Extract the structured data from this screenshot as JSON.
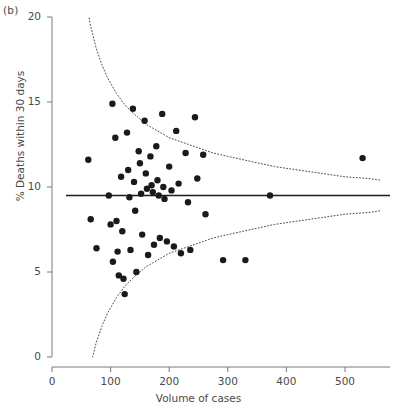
{
  "figure": {
    "panel_label": "(b)",
    "background": "#ffffff",
    "axis_color": "#7a7a7a",
    "point_color": "#1a1a1a",
    "mean_line_color": "#1a1a1a",
    "limit_line_color": "#4a4a4a"
  },
  "chart_data": {
    "type": "scatter",
    "title": "",
    "subtitle": "",
    "xlabel": "Volume of cases",
    "ylabel": "% Deaths within 30 days",
    "xlim": [
      0,
      560
    ],
    "ylim": [
      0,
      20
    ],
    "xticks": [
      0,
      100,
      200,
      300,
      400,
      500
    ],
    "yticks": [
      0,
      5,
      10,
      15,
      20
    ],
    "grid": false,
    "legend": null,
    "annotations": [
      "(b)"
    ],
    "reference_line": {
      "name": "overall mean",
      "style": "solid",
      "y": 9.5
    },
    "control_limits": {
      "name": "95% control limits",
      "style": "dotted",
      "upper": [
        [
          55,
          21.8
        ],
        [
          65,
          19.6
        ],
        [
          75,
          18.2
        ],
        [
          85,
          17.2
        ],
        [
          95,
          16.4
        ],
        [
          110,
          15.5
        ],
        [
          125,
          14.8
        ],
        [
          140,
          14.3
        ],
        [
          160,
          13.7
        ],
        [
          180,
          13.3
        ],
        [
          200,
          12.9
        ],
        [
          225,
          12.6
        ],
        [
          250,
          12.3
        ],
        [
          275,
          12.0
        ],
        [
          300,
          11.8
        ],
        [
          340,
          11.5
        ],
        [
          380,
          11.2
        ],
        [
          420,
          11.0
        ],
        [
          460,
          10.8
        ],
        [
          500,
          10.6
        ],
        [
          540,
          10.5
        ],
        [
          560,
          10.4
        ]
      ],
      "lower": [
        [
          55,
          -2.8
        ],
        [
          65,
          -0.6
        ],
        [
          75,
          0.8
        ],
        [
          85,
          1.8
        ],
        [
          95,
          2.6
        ],
        [
          110,
          3.5
        ],
        [
          125,
          4.2
        ],
        [
          140,
          4.7
        ],
        [
          160,
          5.3
        ],
        [
          180,
          5.7
        ],
        [
          200,
          6.1
        ],
        [
          225,
          6.4
        ],
        [
          250,
          6.7
        ],
        [
          275,
          7.0
        ],
        [
          300,
          7.2
        ],
        [
          340,
          7.5
        ],
        [
          380,
          7.8
        ],
        [
          420,
          8.0
        ],
        [
          460,
          8.2
        ],
        [
          500,
          8.4
        ],
        [
          540,
          8.5
        ],
        [
          560,
          8.6
        ]
      ]
    },
    "series": [
      {
        "name": "hospitals",
        "marker": "circle",
        "color": "#1a1a1a",
        "points": [
          [
            62,
            11.6
          ],
          [
            66,
            8.1
          ],
          [
            76,
            6.4
          ],
          [
            97,
            9.5
          ],
          [
            100,
            7.8
          ],
          [
            103,
            14.9
          ],
          [
            104,
            5.6
          ],
          [
            108,
            12.9
          ],
          [
            110,
            8.0
          ],
          [
            112,
            6.2
          ],
          [
            114,
            4.8
          ],
          [
            118,
            10.6
          ],
          [
            120,
            7.4
          ],
          [
            122,
            4.6
          ],
          [
            124,
            3.7
          ],
          [
            128,
            13.2
          ],
          [
            130,
            11.0
          ],
          [
            132,
            9.4
          ],
          [
            134,
            6.3
          ],
          [
            138,
            14.6
          ],
          [
            140,
            10.3
          ],
          [
            142,
            8.6
          ],
          [
            144,
            5.0
          ],
          [
            148,
            12.1
          ],
          [
            150,
            11.4
          ],
          [
            152,
            9.6
          ],
          [
            154,
            7.2
          ],
          [
            158,
            13.9
          ],
          [
            160,
            10.8
          ],
          [
            162,
            9.9
          ],
          [
            164,
            6.0
          ],
          [
            168,
            11.8
          ],
          [
            170,
            10.1
          ],
          [
            172,
            9.7
          ],
          [
            174,
            6.6
          ],
          [
            178,
            12.4
          ],
          [
            180,
            10.4
          ],
          [
            182,
            9.5
          ],
          [
            184,
            7.0
          ],
          [
            188,
            14.3
          ],
          [
            190,
            10.0
          ],
          [
            192,
            9.3
          ],
          [
            196,
            6.8
          ],
          [
            200,
            11.2
          ],
          [
            204,
            9.8
          ],
          [
            208,
            6.5
          ],
          [
            212,
            13.3
          ],
          [
            216,
            10.2
          ],
          [
            220,
            6.1
          ],
          [
            228,
            12.0
          ],
          [
            232,
            9.1
          ],
          [
            236,
            6.3
          ],
          [
            244,
            14.1
          ],
          [
            248,
            10.5
          ],
          [
            258,
            11.9
          ],
          [
            262,
            8.4
          ],
          [
            292,
            5.7
          ],
          [
            330,
            5.7
          ],
          [
            372,
            9.5
          ],
          [
            530,
            11.7
          ]
        ]
      }
    ]
  }
}
